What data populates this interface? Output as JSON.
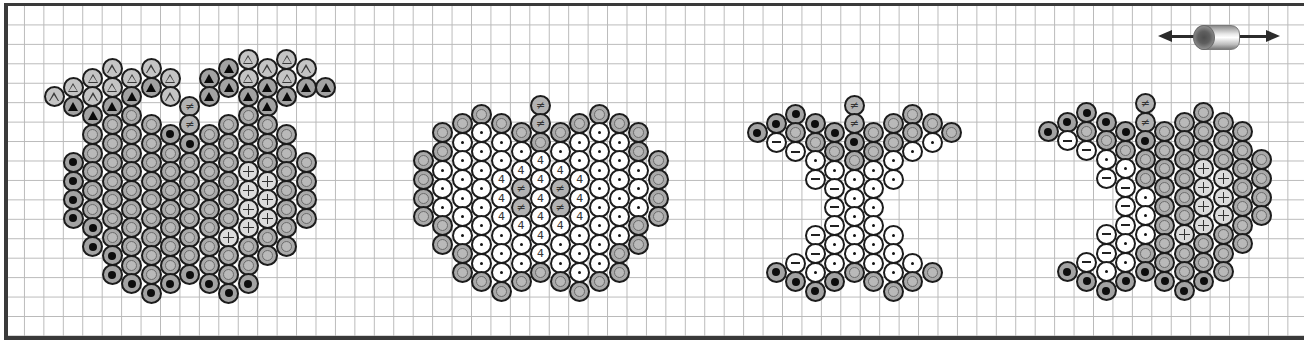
{
  "diagram": {
    "type": "bead-pattern",
    "grid": {
      "cell_px": 19.45,
      "line_color": "#b9b9b9",
      "frame_color": "#3a3a3a"
    },
    "legend_symbols": {
      "tri-open": "△",
      "tri-solid": "▲",
      "ring": "◎",
      "solid": "●",
      "dot": "·",
      "minus": "−",
      "plus": "+",
      "four": "4",
      "neq": "≠"
    },
    "direction_marker": {
      "icon": "double-arrow-with-tube-bead",
      "meaning": "horizontal thread direction"
    }
  },
  "apples": [
    {
      "name": "apple-1-with-leaves",
      "x0": 54,
      "dx": 19.4,
      "y0": 59.5,
      "dy": 9.35,
      "columns": [
        {
          "segments": [
            {
              "h": 4,
              "beads": [
                "tri-open"
              ]
            }
          ]
        },
        {
          "segments": [
            {
              "h": 3,
              "beads": [
                "tri-open",
                "tri-solid"
              ]
            },
            {
              "h": 11,
              "beads": [
                "solid",
                "solid",
                "solid",
                "solid"
              ]
            }
          ]
        },
        {
          "segments": [
            {
              "h": 2,
              "beads": [
                "tri-open",
                "tri-open",
                "tri-solid",
                "ring",
                "ring",
                "ring",
                "ring",
                "ring",
                "solid",
                "solid"
              ]
            }
          ]
        },
        {
          "segments": [
            {
              "h": 1,
              "beads": [
                "tri-open",
                "tri-open",
                "tri-solid",
                "ring",
                "ring",
                "ring",
                "ring",
                "ring",
                "ring",
                "ring",
                "solid",
                "solid"
              ]
            }
          ]
        },
        {
          "segments": [
            {
              "h": 2,
              "beads": [
                "tri-open",
                "tri-solid",
                "ring",
                "ring",
                "ring",
                "ring",
                "ring",
                "ring",
                "ring",
                "ring",
                "ring",
                "solid"
              ]
            }
          ]
        },
        {
          "segments": [
            {
              "h": 1,
              "beads": [
                "tri-open",
                "tri-solid"
              ]
            },
            {
              "h": 7,
              "beads": [
                "ring",
                "ring",
                "ring",
                "ring",
                "ring",
                "ring",
                "ring",
                "ring",
                "ring",
                "solid"
              ]
            }
          ]
        },
        {
          "segments": [
            {
              "h": 2,
              "beads": [
                "tri-open",
                "tri-open"
              ]
            },
            {
              "h": 8,
              "beads": [
                "solid",
                "ring",
                "ring",
                "ring",
                "ring",
                "ring",
                "ring",
                "ring",
                "solid"
              ]
            }
          ]
        },
        {
          "segments": [
            {
              "h": 5,
              "beads": [
                "neq",
                "neq",
                "solid",
                "ring",
                "ring",
                "ring",
                "ring",
                "ring",
                "ring",
                "solid"
              ]
            }
          ]
        },
        {
          "segments": [
            {
              "h": 2,
              "beads": [
                "tri-solid",
                "tri-solid"
              ]
            },
            {
              "h": 8,
              "beads": [
                "ring",
                "ring",
                "ring",
                "ring",
                "ring",
                "ring",
                "ring",
                "ring",
                "solid"
              ]
            }
          ]
        },
        {
          "segments": [
            {
              "h": 1,
              "beads": [
                "tri-solid",
                "tri-solid"
              ]
            },
            {
              "h": 7,
              "beads": [
                "ring",
                "ring",
                "ring",
                "ring",
                "ring",
                "ring",
                "plus",
                "ring",
                "ring",
                "solid"
              ]
            }
          ]
        },
        {
          "segments": [
            {
              "h": 0,
              "beads": [
                "tri-open",
                "tri-open",
                "tri-solid",
                "ring",
                "ring",
                "ring",
                "plus",
                "plus",
                "plus",
                "plus",
                "ring",
                "ring",
                "solid"
              ]
            }
          ]
        },
        {
          "segments": [
            {
              "h": 1,
              "beads": [
                "tri-open",
                "tri-solid",
                "tri-solid",
                "ring",
                "ring",
                "ring",
                "plus",
                "plus",
                "plus",
                "ring",
                "ring"
              ]
            }
          ]
        },
        {
          "segments": [
            {
              "h": 0,
              "beads": [
                "tri-open",
                "tri-open",
                "tri-solid"
              ]
            },
            {
              "h": 8,
              "beads": [
                "ring",
                "ring",
                "ring",
                "ring",
                "ring",
                "ring",
                "ring"
              ]
            }
          ]
        },
        {
          "segments": [
            {
              "h": 1,
              "beads": [
                "tri-open",
                "tri-solid"
              ]
            },
            {
              "h": 11,
              "beads": [
                "ring",
                "ring",
                "ring",
                "ring"
              ]
            }
          ]
        },
        {
          "segments": [
            {
              "h": 3,
              "beads": [
                "tri-solid"
              ]
            }
          ]
        }
      ]
    },
    {
      "name": "apple-2-whole-fruit",
      "x0": 423,
      "dx": 19.6,
      "y0": 105,
      "dy": 9.3,
      "columns": [
        {
          "segments": [
            {
              "h": 6,
              "beads": [
                "ring",
                "ring",
                "ring",
                "ring"
              ]
            }
          ]
        },
        {
          "segments": [
            {
              "h": 3,
              "beads": [
                "ring",
                "ring",
                "dot",
                "dot",
                "dot",
                "ring",
                "ring"
              ]
            }
          ]
        },
        {
          "segments": [
            {
              "h": 2,
              "beads": [
                "ring",
                "dot",
                "dot",
                "dot",
                "dot",
                "dot",
                "dot",
                "ring",
                "ring"
              ]
            }
          ]
        },
        {
          "segments": [
            {
              "h": 1,
              "beads": [
                "ring",
                "dot",
                "dot",
                "dot",
                "dot",
                "dot",
                "dot",
                "dot",
                "dot",
                "ring"
              ]
            }
          ]
        },
        {
          "segments": [
            {
              "h": 2,
              "beads": [
                "ring",
                "dot",
                "dot",
                "four",
                "four",
                "four",
                "dot",
                "dot",
                "dot",
                "ring"
              ]
            }
          ]
        },
        {
          "segments": [
            {
              "h": 3,
              "beads": [
                "ring",
                "dot",
                "four",
                "neq",
                "neq",
                "four",
                "dot",
                "dot",
                "ring"
              ]
            }
          ]
        },
        {
          "segments": [
            {
              "h": 0,
              "beads": [
                "neq",
                "neq",
                "ring",
                "four",
                "four",
                "four",
                "four",
                "four",
                "four",
                "ring"
              ]
            }
          ]
        },
        {
          "segments": [
            {
              "h": 3,
              "beads": [
                "ring",
                "dot",
                "four",
                "neq",
                "neq",
                "four",
                "dot",
                "dot",
                "ring"
              ]
            }
          ]
        },
        {
          "segments": [
            {
              "h": 2,
              "beads": [
                "ring",
                "dot",
                "dot",
                "four",
                "four",
                "four",
                "dot",
                "dot",
                "dot",
                "ring"
              ]
            }
          ]
        },
        {
          "segments": [
            {
              "h": 1,
              "beads": [
                "ring",
                "dot",
                "dot",
                "dot",
                "dot",
                "dot",
                "dot",
                "dot",
                "dot",
                "ring"
              ]
            }
          ]
        },
        {
          "segments": [
            {
              "h": 2,
              "beads": [
                "ring",
                "dot",
                "dot",
                "dot",
                "dot",
                "dot",
                "dot",
                "ring",
                "ring"
              ]
            }
          ]
        },
        {
          "segments": [
            {
              "h": 3,
              "beads": [
                "ring",
                "ring",
                "dot",
                "dot",
                "dot",
                "ring",
                "ring"
              ]
            }
          ]
        },
        {
          "segments": [
            {
              "h": 6,
              "beads": [
                "ring",
                "ring",
                "ring",
                "ring"
              ]
            }
          ]
        }
      ]
    },
    {
      "name": "apple-3-core",
      "x0": 757,
      "dx": 19.45,
      "y0": 105,
      "dy": 9.3,
      "columns": [
        {
          "segments": [
            {
              "h": 3,
              "beads": [
                "solid"
              ]
            }
          ]
        },
        {
          "segments": [
            {
              "h": 2,
              "beads": [
                "solid",
                "minus"
              ]
            },
            {
              "h": 18,
              "beads": [
                "solid"
              ]
            }
          ]
        },
        {
          "segments": [
            {
              "h": 1,
              "beads": [
                "solid",
                "ring",
                "minus"
              ]
            },
            {
              "h": 17,
              "beads": [
                "minus",
                "solid"
              ]
            }
          ]
        },
        {
          "segments": [
            {
              "h": 2,
              "beads": [
                "solid",
                "ring",
                "dot",
                "minus"
              ]
            },
            {
              "h": 14,
              "beads": [
                "minus",
                "minus",
                "dot",
                "solid"
              ]
            }
          ]
        },
        {
          "segments": [
            {
              "h": 3,
              "beads": [
                "solid",
                "ring",
                "dot",
                "minus",
                "minus",
                "minus",
                "dot",
                "dot",
                "solid"
              ]
            }
          ]
        },
        {
          "segments": [
            {
              "h": 0,
              "beads": [
                "neq",
                "neq",
                "solid",
                "ring",
                "dot",
                "dot",
                "dot",
                "dot",
                "dot",
                "ring"
              ]
            }
          ]
        },
        {
          "segments": [
            {
              "h": 3,
              "beads": [
                "ring",
                "ring",
                "dot",
                "dot",
                "dot",
                "dot",
                "dot",
                "dot",
                "ring"
              ]
            }
          ]
        },
        {
          "segments": [
            {
              "h": 2,
              "beads": [
                "ring",
                "ring",
                "dot",
                "dot"
              ]
            },
            {
              "h": 14,
              "beads": [
                "dot",
                "dot",
                "dot",
                "ring"
              ]
            }
          ]
        },
        {
          "segments": [
            {
              "h": 1,
              "beads": [
                "ring",
                "ring",
                "dot"
              ]
            },
            {
              "h": 17,
              "beads": [
                "dot",
                "ring"
              ]
            }
          ]
        },
        {
          "segments": [
            {
              "h": 2,
              "beads": [
                "ring",
                "dot"
              ]
            },
            {
              "h": 18,
              "beads": [
                "ring"
              ]
            }
          ]
        },
        {
          "segments": [
            {
              "h": 3,
              "beads": [
                "ring"
              ]
            }
          ]
        }
      ]
    },
    {
      "name": "apple-4-bitten",
      "x0": 1048,
      "dx": 19.45,
      "y0": 103.5,
      "dy": 9.35,
      "columns": [
        {
          "segments": [
            {
              "h": 3,
              "beads": [
                "solid"
              ]
            }
          ]
        },
        {
          "segments": [
            {
              "h": 2,
              "beads": [
                "solid",
                "minus"
              ]
            },
            {
              "h": 18,
              "beads": [
                "solid"
              ]
            }
          ]
        },
        {
          "segments": [
            {
              "h": 1,
              "beads": [
                "solid",
                "ring",
                "minus"
              ]
            },
            {
              "h": 17,
              "beads": [
                "minus",
                "solid"
              ]
            }
          ]
        },
        {
          "segments": [
            {
              "h": 2,
              "beads": [
                "solid",
                "ring",
                "dot",
                "minus"
              ]
            },
            {
              "h": 14,
              "beads": [
                "minus",
                "minus",
                "dot",
                "solid"
              ]
            }
          ]
        },
        {
          "segments": [
            {
              "h": 3,
              "beads": [
                "solid",
                "ring",
                "dot",
                "minus",
                "minus",
                "minus",
                "dot",
                "dot",
                "solid"
              ]
            }
          ]
        },
        {
          "segments": [
            {
              "h": 0,
              "beads": [
                "neq",
                "neq",
                "solid",
                "ring",
                "ring",
                "dot",
                "dot",
                "dot",
                "ring",
                "solid"
              ]
            }
          ]
        },
        {
          "segments": [
            {
              "h": 3,
              "beads": [
                "ring",
                "ring",
                "ring",
                "ring",
                "ring",
                "ring",
                "ring",
                "ring",
                "solid"
              ]
            }
          ]
        },
        {
          "segments": [
            {
              "h": 2,
              "beads": [
                "ring",
                "ring",
                "ring",
                "ring",
                "ring",
                "ring",
                "plus",
                "ring",
                "ring",
                "solid"
              ]
            }
          ]
        },
        {
          "segments": [
            {
              "h": 1,
              "beads": [
                "ring",
                "ring",
                "ring",
                "plus",
                "plus",
                "plus",
                "plus",
                "ring",
                "ring",
                "solid"
              ]
            }
          ]
        },
        {
          "segments": [
            {
              "h": 2,
              "beads": [
                "ring",
                "ring",
                "ring",
                "plus",
                "plus",
                "plus",
                "ring",
                "ring",
                "ring"
              ]
            }
          ]
        },
        {
          "segments": [
            {
              "h": 3,
              "beads": [
                "ring",
                "ring",
                "ring",
                "ring",
                "ring",
                "ring",
                "ring"
              ]
            }
          ]
        },
        {
          "segments": [
            {
              "h": 6,
              "beads": [
                "ring",
                "ring",
                "ring",
                "ring"
              ]
            }
          ]
        }
      ]
    }
  ]
}
